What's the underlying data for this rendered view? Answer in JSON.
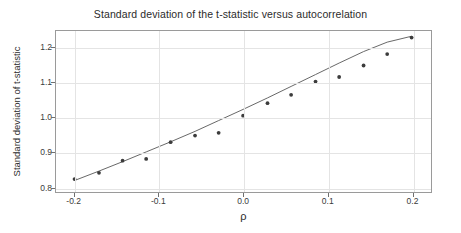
{
  "chart_data": {
    "type": "scatter",
    "title": "Standard deviation of the t-statistic versus autocorrelation",
    "xlabel": "ρ",
    "ylabel": "Standard deviation of t-statistic",
    "xlim": [
      -0.222,
      0.223
    ],
    "ylim": [
      0.785,
      1.247
    ],
    "xticks": [
      -0.2,
      -0.1,
      0.0,
      0.1,
      0.2
    ],
    "xticklabels": [
      "-0.2",
      "-0.1",
      "0.0",
      "0.1",
      "0.2"
    ],
    "yticks": [
      0.8,
      0.9,
      1.0,
      1.1,
      1.2
    ],
    "yticklabels": [
      "0.8",
      "0.9",
      "1.0",
      "1.1",
      "1.2"
    ],
    "grid": true,
    "legend": null,
    "point_color": "#3c3c3c",
    "line_color": "#555555",
    "grid_color": "#e4e4e4",
    "frame_color": "#9a9a9a",
    "x": [
      -0.2,
      -0.171,
      -0.143,
      -0.115,
      -0.086,
      -0.057,
      -0.029,
      0.0,
      0.029,
      0.057,
      0.086,
      0.114,
      0.143,
      0.171,
      0.2
    ],
    "values": [
      0.822,
      0.84,
      0.875,
      0.88,
      0.928,
      0.947,
      0.955,
      1.004,
      1.04,
      1.064,
      1.102,
      1.115,
      1.148,
      1.181,
      1.228
    ],
    "series": [
      {
        "name": "simulated standard deviation",
        "kind": "points",
        "x": [
          -0.2,
          -0.171,
          -0.143,
          -0.115,
          -0.086,
          -0.057,
          -0.029,
          0.0,
          0.029,
          0.057,
          0.086,
          0.114,
          0.143,
          0.171,
          0.2
        ],
        "values": [
          0.822,
          0.84,
          0.875,
          0.88,
          0.928,
          0.947,
          0.955,
          1.004,
          1.04,
          1.064,
          1.102,
          1.115,
          1.148,
          1.181,
          1.228
        ]
      },
      {
        "name": "fitted curve",
        "kind": "line",
        "x": [
          -0.2,
          -0.171,
          -0.143,
          -0.115,
          -0.086,
          -0.057,
          -0.029,
          0.0,
          0.029,
          0.057,
          0.086,
          0.114,
          0.143,
          0.171,
          0.2
        ],
        "values": [
          0.818,
          0.845,
          0.872,
          0.9,
          0.929,
          0.959,
          0.99,
          1.022,
          1.055,
          1.088,
          1.122,
          1.155,
          1.188,
          1.215,
          1.232
        ]
      }
    ]
  }
}
